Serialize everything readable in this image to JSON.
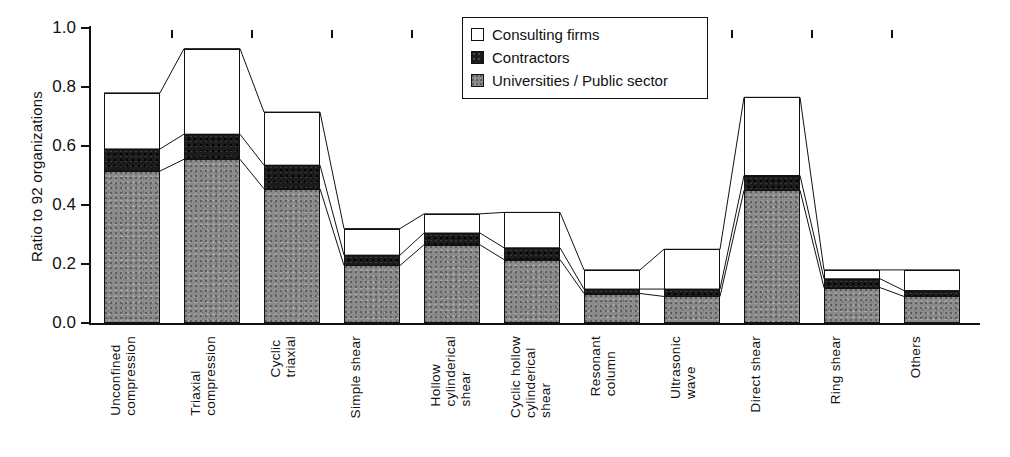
{
  "chart": {
    "type": "bar",
    "ylabel": "Ratio to 92 organizations",
    "xlabel": "",
    "title": ""
  },
  "legend": {
    "position": "top-center",
    "items": [
      {
        "label": "Consulting firms",
        "swatch": "white-square-icon",
        "color": "#ffffff"
      },
      {
        "label": "Contractors",
        "swatch": "black-square-icon",
        "color": "#1b1b1b"
      },
      {
        "label": "Universities / Public sector",
        "swatch": "gray-square-icon",
        "color": "#8a8a8a"
      }
    ]
  },
  "yaxis": {
    "ticks": [
      "0.0",
      "0.2",
      "0.4",
      "0.6",
      "0.8",
      "1.0"
    ],
    "values": [
      0.0,
      0.2,
      0.4,
      0.6,
      0.8,
      1.0
    ],
    "min": 0.0,
    "max": 1.0
  },
  "chart_data": {
    "type": "bar",
    "stacked": true,
    "title": "",
    "xlabel": "",
    "ylabel": "Ratio to 92 organizations",
    "ylim": [
      0.0,
      1.0
    ],
    "grid": false,
    "legend_position": "top-center",
    "categories": [
      "Unconfined\ncompression",
      "Triaxial\ncompression",
      "Cyclic\ntriaxial",
      "Simple shear",
      "Hollow\ncylinderical\nshear",
      "Cyclic hollow\ncylinderical\nshear",
      "Resonant\ncolumn",
      "Ultrasonic\nwave",
      "Direct shear",
      "Ring shear",
      "Others"
    ],
    "series": [
      {
        "name": "Universities / Public sector",
        "color": "#8a8a8a",
        "values": [
          0.515,
          0.555,
          0.455,
          0.195,
          0.265,
          0.215,
          0.1,
          0.09,
          0.45,
          0.12,
          0.09
        ]
      },
      {
        "name": "Contractors",
        "color": "#1b1b1b",
        "values": [
          0.075,
          0.085,
          0.08,
          0.035,
          0.04,
          0.04,
          0.015,
          0.025,
          0.05,
          0.03,
          0.02
        ]
      },
      {
        "name": "Consulting firms",
        "color": "#ffffff",
        "values": [
          0.19,
          0.29,
          0.18,
          0.09,
          0.065,
          0.12,
          0.065,
          0.135,
          0.265,
          0.03,
          0.07
        ]
      }
    ],
    "cumulative_tops": {
      "universities_public_sector": [
        0.515,
        0.555,
        0.455,
        0.195,
        0.265,
        0.215,
        0.1,
        0.09,
        0.45,
        0.12,
        0.09
      ],
      "plus_contractors": [
        0.59,
        0.64,
        0.535,
        0.23,
        0.305,
        0.255,
        0.115,
        0.115,
        0.5,
        0.15,
        0.11
      ],
      "totals": [
        0.78,
        0.93,
        0.715,
        0.32,
        0.37,
        0.375,
        0.18,
        0.25,
        0.765,
        0.18,
        0.18
      ]
    }
  }
}
